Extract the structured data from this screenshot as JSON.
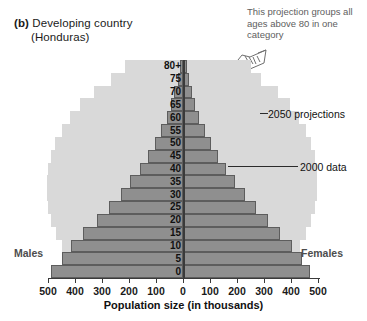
{
  "figure": {
    "panel_tag": "(b)",
    "title": "Developing country",
    "subtitle": "(Honduras)",
    "note": "This projection groups all ages above 80 in one category",
    "hand_icon": "pointing-hand-icon",
    "left_label": "Males",
    "right_label": "Females",
    "annotation_2050": "2050 projections",
    "annotation_2000": "2000 data",
    "xlabel": "Population size (in thousands)"
  },
  "colors": {
    "projection_2050": "#d9d9d9",
    "data_2000": "#8f8f8f",
    "data_2000_edge": "#5d5d5d",
    "axis": "#3a3a3a",
    "note_text": "#5e5e5e",
    "side_label": "#4d4d4d"
  },
  "chart_data": {
    "type": "bar",
    "subtype": "population-pyramid",
    "title": "(b) Developing country (Honduras)",
    "xlabel": "Population size (in thousands)",
    "ylabel": "",
    "xlim": [
      -500,
      500
    ],
    "xticks": [
      500,
      400,
      300,
      200,
      100,
      0,
      100,
      200,
      300,
      400,
      500
    ],
    "xtick_labels": [
      "500",
      "400",
      "300",
      "200",
      "100",
      "0",
      "100",
      "200",
      "300",
      "400",
      "500"
    ],
    "grid": false,
    "legend_position": "annotated-leader-lines",
    "age_groups": [
      "0",
      "5",
      "10",
      "15",
      "20",
      "25",
      "30",
      "35",
      "40",
      "45",
      "50",
      "55",
      "60",
      "65",
      "70",
      "75",
      "80+"
    ],
    "series": [
      {
        "name": "2000 data",
        "color": "#8f8f8f",
        "males": [
          490,
          450,
          415,
          370,
          320,
          275,
          230,
          195,
          160,
          130,
          105,
          80,
          60,
          45,
          32,
          20,
          12
        ],
        "females": [
          470,
          440,
          405,
          360,
          315,
          270,
          228,
          192,
          158,
          128,
          104,
          80,
          60,
          46,
          34,
          22,
          14
        ]
      },
      {
        "name": "2050 projections",
        "color": "#d9d9d9",
        "males": [
          400,
          425,
          450,
          470,
          490,
          500,
          505,
          505,
          500,
          490,
          475,
          450,
          420,
          380,
          330,
          265,
          215
        ],
        "females": [
          385,
          410,
          435,
          455,
          475,
          488,
          495,
          498,
          495,
          488,
          475,
          455,
          430,
          395,
          350,
          290,
          250
        ]
      }
    ]
  }
}
